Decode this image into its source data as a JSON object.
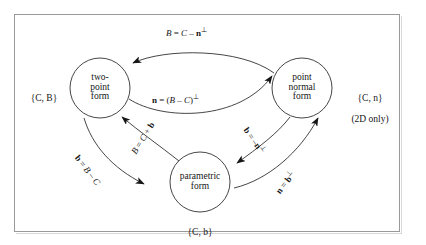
{
  "figure": {
    "background_color": "#ffffff",
    "frame_color": "#9a9a9a",
    "ink_color": "#161616"
  },
  "nodes": [
    {
      "id": "two-point",
      "label": "two-\npoint\nform",
      "set_label": "{C, B}",
      "set_sublabel": ""
    },
    {
      "id": "point-normal",
      "label": "point\nnormal\nform",
      "set_label": "{C, n}",
      "set_sublabel": "(2D only)"
    },
    {
      "id": "parametric",
      "label": "parametric\nform",
      "set_label": "{C, b}",
      "set_sublabel": ""
    }
  ],
  "edges": [
    {
      "id": "pn-to-tp",
      "from": "point-normal",
      "to": "two-point",
      "label_plain": "B = C − n⊥",
      "label_html": "<span class=\"ital\">B</span> = <span class=\"ital\">C</span> – <span class=\"vec\">n</span><span class=\"perp\">⊥</span>",
      "rotation_deg": 0
    },
    {
      "id": "tp-to-pn",
      "from": "two-point",
      "to": "point-normal",
      "label_plain": "n = (B − C)⊥",
      "label_html": "<span class=\"vec\">n</span> = (<span class=\"ital\">B</span> – <span class=\"ital\">C</span>)<span class=\"perp\">⊥</span>",
      "rotation_deg": 0
    },
    {
      "id": "param-to-tp",
      "from": "parametric",
      "to": "two-point",
      "label_plain": "B = C + b",
      "label_html": "<span class=\"ital\">B</span> = <span class=\"ital\">C</span> + <span class=\"vec\">b</span>",
      "rotation_deg": -58
    },
    {
      "id": "tp-to-param",
      "from": "two-point",
      "to": "parametric",
      "label_plain": "b = B − C",
      "label_html": "<span class=\"vec\">b</span> = <span class=\"ital\">B</span> – <span class=\"ital\">C</span>",
      "rotation_deg": 52
    },
    {
      "id": "pn-to-param",
      "from": "point-normal",
      "to": "parametric",
      "label_plain": "b = −n⊥",
      "label_html": "<span class=\"vec\">b</span> = –<span class=\"vec\">n</span><span class=\"perp\">⊥</span>",
      "rotation_deg": 55
    },
    {
      "id": "param-to-pn",
      "from": "parametric",
      "to": "point-normal",
      "label_plain": "n = b⊥",
      "label_html": "<span class=\"vec\">n</span> = <span class=\"vec\">b</span><span class=\"perp\">⊥</span>",
      "rotation_deg": -52
    }
  ],
  "margin": {
    "marks": "·\n·"
  }
}
